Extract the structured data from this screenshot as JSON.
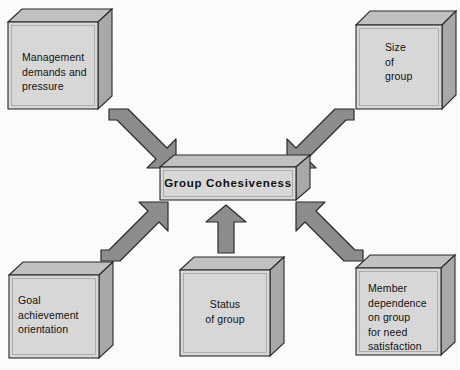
{
  "diagram": {
    "title": "Group Cohesiveness",
    "type": "influence-diagram",
    "background_color": "#fdfdfd",
    "box_face_color": "#d8d8d8",
    "box_side_color": "#a9a9a9",
    "box_top_color": "#c2c2c2",
    "box_outline_color": "#2b2b2b",
    "arrow_fill_color": "#8e8e8e",
    "arrow_outline_color": "#2b2b2b",
    "text_color": "#111111"
  },
  "center": {
    "id": "group-cohesiveness",
    "label": "Group  Cohesiveness"
  },
  "factors": [
    {
      "id": "management-demands",
      "label": "Management\ndemands and\npressure",
      "position": "top-left",
      "align": "left"
    },
    {
      "id": "size-of-group",
      "label": "Size\nof\ngroup",
      "position": "top-right",
      "align": "left"
    },
    {
      "id": "goal-achievement-orientation",
      "label": "Goal\nachievement\norientation",
      "position": "bottom-left",
      "align": "left"
    },
    {
      "id": "status-of-group",
      "label": "Status\nof group",
      "position": "bottom-center",
      "align": "center"
    },
    {
      "id": "member-dependence",
      "label": "Member\ndependence\non group\nfor need\nsatisfaction",
      "position": "bottom-right",
      "align": "left"
    }
  ],
  "arrows": [
    {
      "id": "arrow-management-to-center",
      "from": "management-demands",
      "to": "group-cohesiveness",
      "direction": "down-right"
    },
    {
      "id": "arrow-size-to-center",
      "from": "size-of-group",
      "to": "group-cohesiveness",
      "direction": "down-left"
    },
    {
      "id": "arrow-goal-to-center",
      "from": "goal-achievement-orientation",
      "to": "group-cohesiveness",
      "direction": "up-right"
    },
    {
      "id": "arrow-status-to-center",
      "from": "status-of-group",
      "to": "group-cohesiveness",
      "direction": "up"
    },
    {
      "id": "arrow-member-to-center",
      "from": "member-dependence",
      "to": "group-cohesiveness",
      "direction": "up-left"
    }
  ]
}
